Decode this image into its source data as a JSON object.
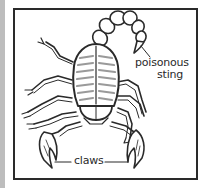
{
  "diagram": {
    "labels": {
      "sting_line1": "poisonous",
      "sting_line2": "sting",
      "claws": "claws"
    },
    "colors": {
      "ink": "#2a2a2a",
      "shading": "#9a9a9a",
      "background": "#ffffff",
      "frame": "#2a2a2a",
      "left_strip": "#bdbdbd"
    }
  }
}
